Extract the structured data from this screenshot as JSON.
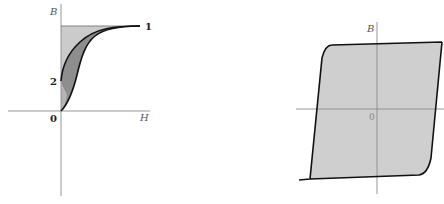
{
  "left_diagram": {
    "axes": {
      "y_label": "B",
      "x_label": "H",
      "origin_label": "0"
    },
    "points": {
      "point_1_label": "1",
      "point_2_label": "2"
    },
    "colors": {
      "light_fill": "#c8c8c8",
      "dark_fill": "#8f8f8f",
      "curve": "#111111",
      "axis": "#888888"
    }
  },
  "right_diagram": {
    "axes": {
      "y_label": "B",
      "origin_label": "0"
    },
    "colors": {
      "loop_fill": "#cfcfcf",
      "loop_stroke": "#111111",
      "axis": "#888888"
    }
  }
}
